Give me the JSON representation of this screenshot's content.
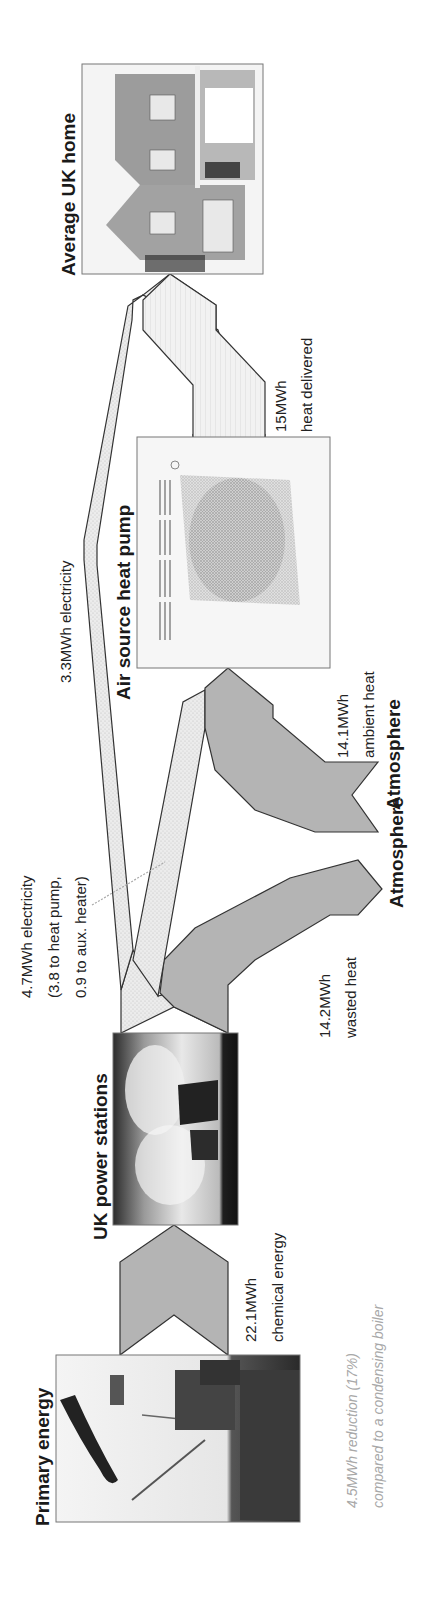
{
  "diagram": {
    "orientation": "rotated -90 degrees (reads bottom to top)",
    "nodes": {
      "primary": {
        "label": "Primary energy",
        "image": "offshore-oil-platform-photo"
      },
      "power": {
        "label": "UK power stations",
        "image": "power-station-cooling-towers-photo"
      },
      "heatpump": {
        "label": "Air source heat pump",
        "image": "heat-pump-unit-photo"
      },
      "home": {
        "label": "Average UK home",
        "image": "house-photo"
      },
      "atmosphere_1": {
        "label": "Atmosphere"
      },
      "atmosphere_2": {
        "label": "Atmosphere"
      }
    },
    "flows": {
      "chemical": {
        "line1": "22.1MWh",
        "line2": "chemical energy",
        "value_mwh": 22.1
      },
      "electricity_total": {
        "line1": "4.7MWh electricity",
        "line2": "(3.8 to heat pump,",
        "line3": "0.9 to aux. heater)",
        "value_mwh": 4.7
      },
      "wasted": {
        "line1": "14.2MWh",
        "line2": "wasted heat",
        "value_mwh": 14.2
      },
      "ambient": {
        "line1": "14.1MWh",
        "line2": "ambient heat",
        "value_mwh": 14.1
      },
      "electricity_direct": {
        "line1": "3.3MWh electricity",
        "value_mwh": 3.3
      },
      "delivered": {
        "line1": "15MWh",
        "line2": "heat delivered",
        "value_mwh": 15
      }
    },
    "note": {
      "line1": "4.5MWh reduction (17%)",
      "line2": "compared to a condensing boiler"
    },
    "colors": {
      "flow_gray": "#b4b4b4",
      "flow_electricity": "#e4e4e4",
      "flow_heat": "#eeeeee",
      "outline": "#333333",
      "note_text": "#a8a8a8"
    }
  }
}
